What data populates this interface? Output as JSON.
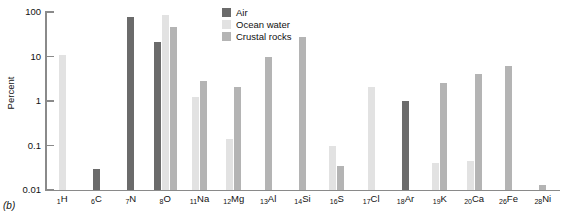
{
  "figure": {
    "label": "(b)"
  },
  "legend": {
    "position": "top-center",
    "items": [
      {
        "label": "Air",
        "color": "#6b6b6b",
        "key": "air"
      },
      {
        "label": "Ocean water",
        "color": "#e2e2e2",
        "key": "ocean"
      },
      {
        "label": "Crustal rocks",
        "color": "#b4b4b4",
        "key": "crustal"
      }
    ]
  },
  "axes": {
    "y_title": "Percent",
    "y_ticks": [
      "100",
      "10",
      "1",
      "0.1",
      "0.01"
    ]
  },
  "chart_data": {
    "type": "bar",
    "title": "",
    "xlabel": "",
    "ylabel": "Percent",
    "yscale": "log",
    "ylim": [
      0.01,
      100
    ],
    "yticks": [
      0.01,
      0.1,
      1,
      10,
      100
    ],
    "grid": false,
    "legend_position": "top-center",
    "categories": [
      "1H",
      "6C",
      "7N",
      "8O",
      "11Na",
      "12Mg",
      "13Al",
      "14Si",
      "16S",
      "17Cl",
      "18Ar",
      "19K",
      "20Ca",
      "26Fe",
      "28Ni"
    ],
    "category_labels": [
      {
        "number": "1",
        "symbol": "H"
      },
      {
        "number": "6",
        "symbol": "C"
      },
      {
        "number": "7",
        "symbol": "N"
      },
      {
        "number": "8",
        "symbol": "O"
      },
      {
        "number": "11",
        "symbol": "Na"
      },
      {
        "number": "12",
        "symbol": "Mg"
      },
      {
        "number": "13",
        "symbol": "Al"
      },
      {
        "number": "14",
        "symbol": "Si"
      },
      {
        "number": "16",
        "symbol": "S"
      },
      {
        "number": "17",
        "symbol": "Cl"
      },
      {
        "number": "18",
        "symbol": "Ar"
      },
      {
        "number": "19",
        "symbol": "K"
      },
      {
        "number": "20",
        "symbol": "Ca"
      },
      {
        "number": "26",
        "symbol": "Fe"
      },
      {
        "number": "28",
        "symbol": "Ni"
      }
    ],
    "series": [
      {
        "name": "Air",
        "color": "#6b6b6b",
        "values": [
          null,
          0.03,
          78,
          21,
          null,
          null,
          null,
          null,
          null,
          null,
          1.0,
          null,
          null,
          null,
          null
        ]
      },
      {
        "name": "Ocean water",
        "color": "#e2e2e2",
        "values": [
          11,
          null,
          null,
          86,
          1.2,
          0.14,
          null,
          null,
          0.1,
          2.1,
          null,
          0.04,
          0.045,
          null,
          null
        ]
      },
      {
        "name": "Crustal rocks",
        "color": "#b4b4b4",
        "values": [
          null,
          null,
          null,
          47,
          2.8,
          2.1,
          10,
          28,
          0.035,
          null,
          null,
          2.5,
          4.0,
          6.0,
          0.013
        ]
      }
    ]
  }
}
